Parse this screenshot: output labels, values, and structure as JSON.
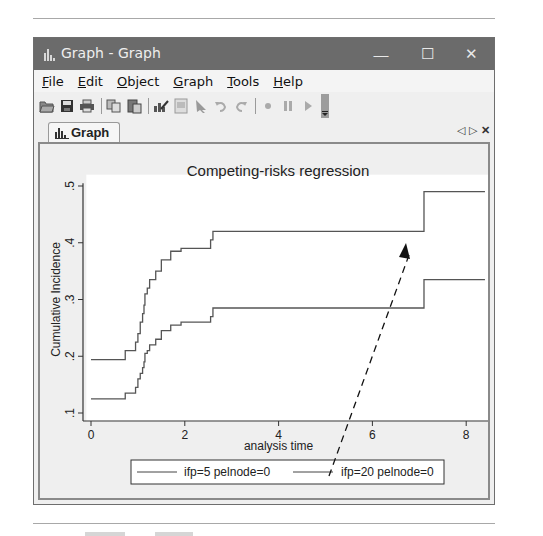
{
  "window": {
    "title": "Graph - Graph",
    "controls": {
      "minimize": "—",
      "maximize": "☐",
      "close": "✕"
    }
  },
  "menu": {
    "items": [
      {
        "label": "File",
        "accel": "F",
        "rest": "ile"
      },
      {
        "label": "Edit",
        "accel": "E",
        "rest": "dit"
      },
      {
        "label": "Object",
        "accel": "O",
        "rest": "bject"
      },
      {
        "label": "Graph",
        "accel": "G",
        "rest": "raph"
      },
      {
        "label": "Tools",
        "accel": "T",
        "rest": "ools"
      },
      {
        "label": "Help",
        "accel": "H",
        "rest": "elp"
      }
    ]
  },
  "toolbar": {
    "buttons": [
      "open-icon",
      "save-icon",
      "print-icon",
      "copy-icon",
      "paste-icon",
      "graph-editor-icon",
      "properties-icon",
      "pointer-icon",
      "undo-icon",
      "redo-icon",
      "record-icon",
      "pause-icon",
      "play-icon"
    ]
  },
  "tabs": {
    "active": "Graph",
    "nav": {
      "prev": "◁",
      "next": "▷",
      "close": "✕"
    }
  },
  "chart_data": {
    "type": "line",
    "subtype": "step",
    "title": "Competing-risks regression",
    "xlabel": "analysis time",
    "ylabel": "Cumulative Incidence",
    "xlim": [
      0,
      8.5
    ],
    "ylim": [
      0.1,
      0.5
    ],
    "xticks": [
      "0",
      "2",
      "4",
      "6",
      "8"
    ],
    "yticks": [
      ".1",
      ".2",
      ".3",
      ".4",
      ".5"
    ],
    "grid": false,
    "legend_position": "bottom",
    "series": [
      {
        "name": "ifp=5 pelnode=0",
        "x": [
          0,
          0.73,
          0.95,
          1.0,
          1.05,
          1.1,
          1.13,
          1.15,
          1.2,
          1.25,
          1.38,
          1.5,
          1.7,
          1.92,
          2.55,
          2.6,
          2.65,
          7.1,
          7.1,
          8.4
        ],
        "y": [
          0.194,
          0.21,
          0.225,
          0.24,
          0.26,
          0.275,
          0.29,
          0.31,
          0.32,
          0.335,
          0.35,
          0.37,
          0.385,
          0.39,
          0.405,
          0.42,
          0.42,
          0.42,
          0.49,
          0.49
        ]
      },
      {
        "name": "ifp=20 pelnode=0",
        "x": [
          0,
          0.73,
          0.95,
          1.0,
          1.05,
          1.1,
          1.13,
          1.15,
          1.2,
          1.25,
          1.38,
          1.5,
          1.7,
          1.92,
          2.55,
          2.6,
          2.65,
          7.1,
          7.1,
          8.4
        ],
        "y": [
          0.125,
          0.135,
          0.145,
          0.16,
          0.17,
          0.18,
          0.19,
          0.205,
          0.21,
          0.22,
          0.23,
          0.245,
          0.255,
          0.26,
          0.27,
          0.285,
          0.285,
          0.285,
          0.335,
          0.335
        ]
      }
    ],
    "annotations": [
      {
        "type": "arrow",
        "style": "dashed",
        "from": [
          5.2,
          0.0
        ],
        "to": [
          6.7,
          0.42
        ]
      }
    ]
  }
}
